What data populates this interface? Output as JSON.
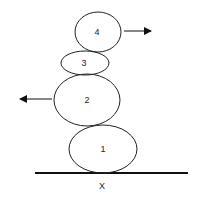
{
  "diagram": {
    "ground": {
      "x1": 35,
      "x2": 188,
      "y": 173,
      "label": "X"
    },
    "bodies": [
      {
        "id": "1",
        "label": "1",
        "cx": 103,
        "cy": 149,
        "rx": 34,
        "ry": 24
      },
      {
        "id": "2",
        "label": "2",
        "cx": 87,
        "cy": 100,
        "rx": 33,
        "ry": 26
      },
      {
        "id": "3",
        "label": "3",
        "cx": 85,
        "cy": 63,
        "rx": 24,
        "ry": 12
      },
      {
        "id": "4",
        "label": "4",
        "cx": 98,
        "cy": 32,
        "rx": 23,
        "ry": 20
      }
    ],
    "arrows": [
      {
        "on": "4",
        "direction": "right",
        "x1": 124,
        "x2": 151,
        "y": 31
      },
      {
        "on": "2",
        "direction": "left",
        "x1": 52,
        "x2": 20,
        "y": 99
      }
    ]
  }
}
